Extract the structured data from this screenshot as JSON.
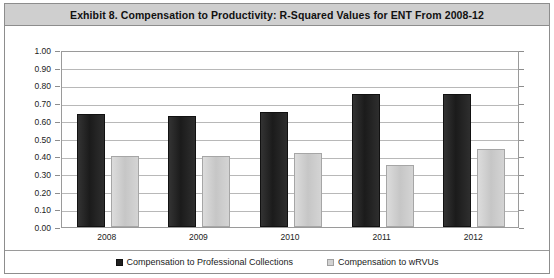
{
  "exhibit": {
    "title": "Exhibit 8. Compensation to Productivity: R-Squared Values for ENT From 2008-12"
  },
  "colors": {
    "series_dark": "#262626",
    "series_light": "#cfcfcf",
    "title_bar": "#cfcfcf",
    "border": "#8d8d8d",
    "gridline": "#b8b8b8"
  },
  "legend": {
    "position": "bottom",
    "entries": [
      {
        "label": "Compensation to Professional Collections",
        "marker": "dark-square-swatch"
      },
      {
        "label": "Compensation to wRVUs",
        "marker": "light-square-swatch"
      }
    ]
  },
  "chart_data": {
    "type": "bar",
    "title": "Exhibit 8. Compensation to Productivity: R-Squared Values for ENT From 2008-12",
    "xlabel": "",
    "ylabel": "",
    "categories": [
      "2008",
      "2009",
      "2010",
      "2011",
      "2012"
    ],
    "series": [
      {
        "name": "Compensation to Professional Collections",
        "values": [
          0.64,
          0.63,
          0.65,
          0.75,
          0.75
        ]
      },
      {
        "name": "Compensation to wRVUs",
        "values": [
          0.4,
          0.4,
          0.42,
          0.35,
          0.44
        ]
      }
    ],
    "ylim": [
      0.0,
      1.0
    ],
    "ytick_step": 0.1,
    "yticks": [
      "1.00",
      "0.90",
      "0.80",
      "0.70",
      "0.60",
      "0.50",
      "0.40",
      "0.30",
      "0.20",
      "0.10",
      "0.00"
    ],
    "grid": true,
    "legend_position": "bottom"
  }
}
